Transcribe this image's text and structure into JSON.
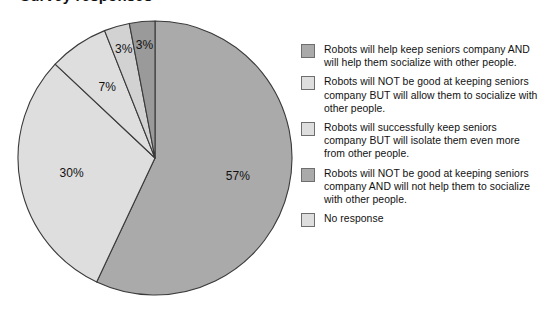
{
  "title": "Survey responses",
  "colors": {
    "background": "#ffffff",
    "slice_border": "#3a3a3a",
    "swatch_border": "#6e6e6e",
    "text": "#111111"
  },
  "chart_data": {
    "type": "pie",
    "title": "Survey responses",
    "xlabel": "",
    "ylabel": "",
    "grid": false,
    "legend_position": "right",
    "start_angle_deg": 0,
    "direction": "clockwise",
    "categories": [
      "Robots will help keep seniors company AND will help them socialize with other people.",
      "Robots will NOT be good at keeping seniors company BUT will allow them to socialize with other people.",
      "Robots will successfully keep seniors company BUT will isolate them even more from other people.",
      "Robots will NOT be good at keeping seniors company AND will not help them to socialize with other people.",
      "No response"
    ],
    "values": [
      57,
      30,
      7,
      3,
      3
    ],
    "value_labels": [
      "57%",
      "30%",
      "7%",
      "3%",
      "3%"
    ],
    "slice_colors": [
      "#aaaaaa",
      "#dedede",
      "#dedede",
      "#d2d2d2",
      "#9a9a9a"
    ],
    "units": "percent"
  },
  "legend": {
    "items": [
      {
        "label": "Robots will help keep seniors company AND will help them socialize with other people.",
        "color": "#aaaaaa"
      },
      {
        "label": "Robots will NOT be good at keeping seniors company BUT will allow them to socialize with other people.",
        "color": "#dedede"
      },
      {
        "label": "Robots will successfully keep seniors company BUT will isolate them even more from other people.",
        "color": "#dedede"
      },
      {
        "label": "Robots will NOT be good at keeping seniors company AND will not help them to socialize with other people.",
        "color": "#aaaaaa"
      },
      {
        "label": "No response",
        "color": "#dedede"
      }
    ]
  }
}
